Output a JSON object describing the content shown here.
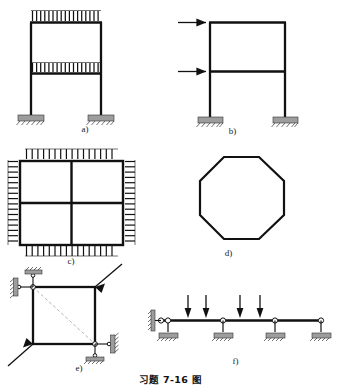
{
  "document": {
    "caption": "习题 7-16 图",
    "caption_icon": "figure-caption"
  },
  "figures": [
    {
      "id": "a",
      "label": "a)",
      "type": "two-story-portal-frame",
      "description": "Two-story plane frame with uniformly distributed downward loads on both beams and fixed supports at both column bases.",
      "loads": [
        {
          "kind": "distributed",
          "direction": "down",
          "location": "upper-beam",
          "arrow_count": 17
        },
        {
          "kind": "distributed",
          "direction": "down",
          "location": "lower-beam",
          "arrow_count": 17
        }
      ],
      "supports": [
        {
          "kind": "fixed",
          "position": "left-column-base"
        },
        {
          "kind": "fixed",
          "position": "right-column-base"
        }
      ]
    },
    {
      "id": "b",
      "label": "b)",
      "type": "two-story-portal-frame",
      "description": "Two-story plane frame loaded by two horizontal concentrated forces applied at the left joints, fixed supports at both column bases.",
      "loads": [
        {
          "kind": "concentrated",
          "direction": "right",
          "location": "upper-left-joint"
        },
        {
          "kind": "concentrated",
          "direction": "right",
          "location": "lower-left-joint"
        }
      ],
      "supports": [
        {
          "kind": "fixed",
          "position": "left-column-base"
        },
        {
          "kind": "fixed",
          "position": "right-column-base"
        }
      ]
    },
    {
      "id": "c",
      "label": "c)",
      "type": "closed-square-grid-frame",
      "description": "Closed square frame divided into four panels by a central horizontal and a central vertical member, uniformly loaded inward on all four sides.",
      "loads": [
        {
          "kind": "distributed",
          "direction": "down",
          "location": "top-edge",
          "arrow_count": 16
        },
        {
          "kind": "distributed",
          "direction": "up",
          "location": "bottom-edge",
          "arrow_count": 16
        },
        {
          "kind": "distributed",
          "direction": "right",
          "location": "left-edge",
          "arrow_count": 16
        },
        {
          "kind": "distributed",
          "direction": "left",
          "location": "right-edge",
          "arrow_count": 16
        }
      ],
      "supports": []
    },
    {
      "id": "d",
      "label": "d)",
      "type": "closed-octagonal-ring-frame",
      "description": "Unloaded closed octagonal ring frame with no external supports.",
      "loads": [],
      "supports": [],
      "sides": 8
    },
    {
      "id": "e",
      "label": "e)",
      "type": "closed-square-frame-diagonal-load",
      "description": "Closed square frame loaded by a pair of opposite diagonal forces along the dashed diagonal, supported by two pairs of perpendicular links at the top-left and bottom-right corners.",
      "loads": [
        {
          "kind": "concentrated",
          "direction": "up-right",
          "location": "top-right-corner"
        },
        {
          "kind": "concentrated",
          "direction": "down-left",
          "location": "bottom-left-corner"
        }
      ],
      "supports": [
        {
          "kind": "link-pair",
          "position": "top-left-corner"
        },
        {
          "kind": "link-pair",
          "position": "bottom-right-corner"
        }
      ],
      "diagonal": "dashed"
    },
    {
      "id": "f",
      "label": "f)",
      "type": "continuous-beam",
      "description": "Continuous beam on four supports carrying four downward concentrated forces.",
      "loads": [
        {
          "kind": "concentrated",
          "direction": "down",
          "index": 1
        },
        {
          "kind": "concentrated",
          "direction": "down",
          "index": 2
        },
        {
          "kind": "concentrated",
          "direction": "down",
          "index": 3
        },
        {
          "kind": "concentrated",
          "direction": "down",
          "index": 4
        }
      ],
      "supports": [
        {
          "kind": "pin-with-wall-link",
          "position": "left-end"
        },
        {
          "kind": "roller",
          "position": "interior-1"
        },
        {
          "kind": "roller",
          "position": "interior-2"
        },
        {
          "kind": "roller",
          "position": "right-end"
        }
      ]
    }
  ]
}
